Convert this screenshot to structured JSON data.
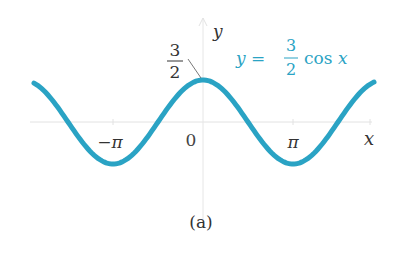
{
  "chart_data": {
    "type": "line",
    "title": "",
    "caption": "(a)",
    "xlabel": "x",
    "ylabel": "y",
    "series": [
      {
        "name": "y = 3/2 cos x",
        "function": "1.5*cos(x)",
        "color": "#2AA3C4",
        "x": [
          -4.0,
          -3.14159,
          -1.5708,
          0,
          1.5708,
          3.14159,
          4.0
        ],
        "values": [
          -0.98,
          -1.5,
          0,
          1.5,
          0,
          -1.5,
          -0.98
        ]
      }
    ],
    "x_ticks": [
      "-π",
      "0",
      "π"
    ],
    "x_tick_values": [
      -3.14159,
      0,
      3.14159
    ],
    "annotations": [
      {
        "text": "3/2",
        "points_to": [
          0,
          1.5
        ]
      },
      {
        "text": "y = 3/2 cos x",
        "color": "#2AA3C4"
      }
    ],
    "xlim": [
      -3.8,
      3.8
    ],
    "ylim": [
      -1.6,
      1.9
    ],
    "grid": false,
    "legend_position": "none"
  },
  "labels": {
    "y_axis": "y",
    "x_axis": "x",
    "amp_num": "3",
    "amp_den": "2",
    "eq_lhs": "y =",
    "eq_num": "3",
    "eq_den": "2",
    "eq_rhs": "cos x",
    "tick_neg_pi": "−π",
    "tick_zero": "0",
    "tick_pi": "π",
    "caption": "(a)"
  },
  "colors": {
    "curve": "#2AA3C4",
    "axis": "#e2e2e2",
    "text": "#333333"
  }
}
